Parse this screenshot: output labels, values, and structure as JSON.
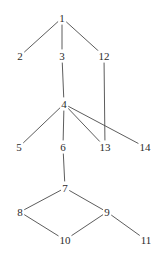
{
  "figure": {
    "width": 167,
    "height": 255,
    "background_color": "#ffffff",
    "edge_color": "#4a4a4a",
    "label_color": "#2b2b2b"
  },
  "chart_data": {
    "type": "diagram",
    "subtype": "node-link-graph",
    "title": "",
    "xlabel": "",
    "ylabel": "",
    "grid": false,
    "legend": "none",
    "directed": false,
    "node_count": 14,
    "edge_count": 15,
    "nodes": [
      {
        "id": "1",
        "label": "1",
        "x": 62,
        "y": 18
      },
      {
        "id": "2",
        "label": "2",
        "x": 20,
        "y": 56
      },
      {
        "id": "3",
        "label": "3",
        "x": 62,
        "y": 56
      },
      {
        "id": "12",
        "label": "12",
        "x": 104,
        "y": 56
      },
      {
        "id": "4",
        "label": "4",
        "x": 64,
        "y": 104
      },
      {
        "id": "5",
        "label": "5",
        "x": 19,
        "y": 147
      },
      {
        "id": "6",
        "label": "6",
        "x": 63,
        "y": 147
      },
      {
        "id": "13",
        "label": "13",
        "x": 105,
        "y": 147
      },
      {
        "id": "14",
        "label": "14",
        "x": 145,
        "y": 147
      },
      {
        "id": "7",
        "label": "7",
        "x": 65,
        "y": 188
      },
      {
        "id": "8",
        "label": "8",
        "x": 20,
        "y": 212
      },
      {
        "id": "9",
        "label": "9",
        "x": 107,
        "y": 212
      },
      {
        "id": "10",
        "label": "10",
        "x": 65,
        "y": 240
      },
      {
        "id": "11",
        "label": "11",
        "x": 146,
        "y": 240
      }
    ],
    "edges": [
      {
        "source": "1",
        "target": "2"
      },
      {
        "source": "1",
        "target": "3"
      },
      {
        "source": "1",
        "target": "12"
      },
      {
        "source": "3",
        "target": "4"
      },
      {
        "source": "12",
        "target": "13"
      },
      {
        "source": "4",
        "target": "5"
      },
      {
        "source": "4",
        "target": "6"
      },
      {
        "source": "4",
        "target": "13"
      },
      {
        "source": "4",
        "target": "14"
      },
      {
        "source": "6",
        "target": "7"
      },
      {
        "source": "7",
        "target": "8"
      },
      {
        "source": "7",
        "target": "9"
      },
      {
        "source": "8",
        "target": "10"
      },
      {
        "source": "9",
        "target": "10"
      },
      {
        "source": "9",
        "target": "11"
      }
    ]
  }
}
